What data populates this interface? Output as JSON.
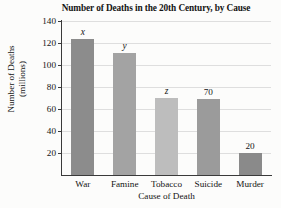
{
  "chart_data": {
    "type": "bar",
    "title": "Number of Deaths in the 20th Century, by Cause",
    "xlabel": "Cause of Death",
    "ylabel_line1": "Number of Deaths",
    "ylabel_line2": "(millions)",
    "categories": [
      "War",
      "Famine",
      "Tobacco",
      "Suicide",
      "Murder"
    ],
    "values": [
      124,
      111,
      70,
      69,
      20
    ],
    "data_labels": [
      "x",
      "y",
      "z",
      "70",
      "20"
    ],
    "label_styles": [
      "italic",
      "italic",
      "italic",
      "normal",
      "normal"
    ],
    "bar_colors": [
      "#8c8c8c",
      "#a3a3a3",
      "#bdbdbd",
      "#9b9b9b",
      "#8a8a8a"
    ],
    "ylim": [
      0,
      140
    ],
    "ytick_labels": [
      "20",
      "40",
      "60",
      "80",
      "100",
      "120",
      "140"
    ],
    "ytick_values": [
      20,
      40,
      60,
      80,
      100,
      120,
      140
    ],
    "grid": true,
    "legend": "none",
    "background_color": "#fcfcfb",
    "axis_color": "#3a3a3a",
    "grid_color": "#dedede"
  }
}
